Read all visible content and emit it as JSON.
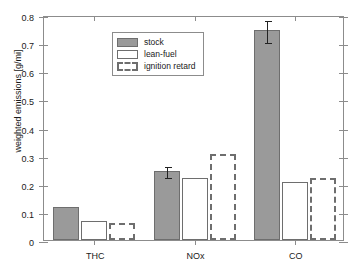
{
  "chart_data": {
    "type": "bar",
    "title": "",
    "xlabel": "",
    "ylabel": "weighted emissions [g/mi]",
    "categories": [
      "THC",
      "NOx",
      "CO"
    ],
    "ylim": [
      0,
      0.8
    ],
    "ytick_labels": [
      "0",
      "0.1",
      "0.2",
      "0.3",
      "0.4",
      "0.5",
      "0.6",
      "0.7",
      "0.8"
    ],
    "ytick_values": [
      0,
      0.1,
      0.2,
      0.3,
      0.4,
      0.5,
      0.6,
      0.7,
      0.8
    ],
    "grid": false,
    "legend_position": "upper left",
    "series": [
      {
        "name": "stock",
        "style": "filled-gray",
        "color": "#9a9a9a",
        "values": [
          0.117,
          0.245,
          0.745
        ],
        "errors": [
          0.003,
          0.02,
          0.042
        ]
      },
      {
        "name": "lean-fuel",
        "style": "open",
        "color": "#ffffff",
        "values": [
          0.068,
          0.222,
          0.205
        ],
        "errors": [
          0,
          0,
          0
        ]
      },
      {
        "name": "ignition retard",
        "style": "dashed",
        "color": "#ffffff",
        "values": [
          0.062,
          0.305,
          0.222
        ],
        "errors": [
          0,
          0,
          0
        ]
      }
    ]
  },
  "legend": {
    "items": [
      {
        "label": "stock"
      },
      {
        "label": "lean-fuel"
      },
      {
        "label": "ignition retard"
      }
    ]
  }
}
